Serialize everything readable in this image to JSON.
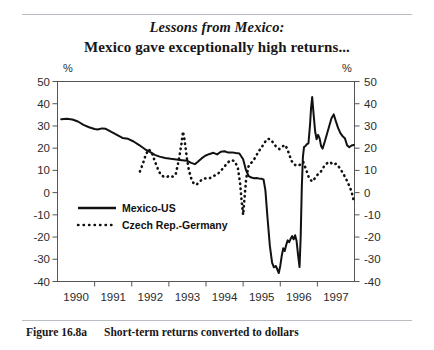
{
  "title": {
    "line1": "Lessons from Mexico:",
    "line2": "Mexico gave exceptionally high returns..."
  },
  "caption": {
    "label": "Figure 16.8a",
    "text": "Short-term returns converted to dollars"
  },
  "colors": {
    "ink": "#111111",
    "axis": "#555555",
    "rule": "#b9bcc2",
    "background": "#ffffff"
  },
  "chart_data": {
    "type": "line",
    "title": "Mexico gave exceptionally high returns...",
    "subtitle": "Lessons from Mexico:",
    "xlabel": "",
    "ylabel": "%",
    "ylabel_right": "%",
    "ylim": [
      -40,
      50
    ],
    "yticks": [
      50,
      40,
      30,
      20,
      10,
      0,
      -10,
      -20,
      -30,
      -40
    ],
    "ytick_labels": [
      "50",
      "40",
      "30",
      "20",
      "10",
      "0",
      "-10",
      "-20",
      "-30",
      "-40"
    ],
    "ytick_labels_right": [
      "50",
      "40",
      "30",
      "20",
      "10",
      "0",
      "-10",
      "-20",
      "-30",
      "-40"
    ],
    "xlim": [
      1989.5,
      1997.5
    ],
    "xticks": [
      1990,
      1991,
      1992,
      1993,
      1994,
      1995,
      1996,
      1997
    ],
    "xtick_labels": [
      "1990",
      "1991",
      "1992",
      "1993",
      "1994",
      "1995",
      "1996",
      "1997"
    ],
    "grid": false,
    "legend_position": "center-left",
    "series": [
      {
        "name": "Mexico-US",
        "style": "solid",
        "color": "#111111",
        "points": [
          [
            1989.6,
            33.0
          ],
          [
            1989.75,
            33.2
          ],
          [
            1989.9,
            32.9
          ],
          [
            1990.05,
            32.0
          ],
          [
            1990.2,
            30.5
          ],
          [
            1990.35,
            29.4
          ],
          [
            1990.5,
            28.6
          ],
          [
            1990.58,
            28.4
          ],
          [
            1990.7,
            28.9
          ],
          [
            1990.8,
            28.7
          ],
          [
            1990.95,
            27.3
          ],
          [
            1991.1,
            26.0
          ],
          [
            1991.25,
            24.6
          ],
          [
            1991.4,
            24.2
          ],
          [
            1991.55,
            23.0
          ],
          [
            1991.7,
            21.4
          ],
          [
            1991.85,
            19.6
          ],
          [
            1992.0,
            18.2
          ],
          [
            1992.12,
            17.0
          ],
          [
            1992.25,
            16.2
          ],
          [
            1992.4,
            15.6
          ],
          [
            1992.55,
            15.2
          ],
          [
            1992.7,
            14.9
          ],
          [
            1992.85,
            14.6
          ],
          [
            1993.0,
            14.3
          ],
          [
            1993.1,
            13.4
          ],
          [
            1993.2,
            12.8
          ],
          [
            1993.28,
            13.9
          ],
          [
            1993.38,
            15.4
          ],
          [
            1993.48,
            16.6
          ],
          [
            1993.58,
            17.3
          ],
          [
            1993.7,
            17.9
          ],
          [
            1993.8,
            17.2
          ],
          [
            1993.9,
            18.4
          ],
          [
            1994.0,
            18.6
          ],
          [
            1994.1,
            18.0
          ],
          [
            1994.2,
            18.1
          ],
          [
            1994.3,
            17.8
          ],
          [
            1994.4,
            17.6
          ],
          [
            1994.5,
            15.0
          ],
          [
            1994.58,
            10.0
          ],
          [
            1994.65,
            7.4
          ],
          [
            1994.72,
            6.8
          ],
          [
            1994.8,
            6.5
          ],
          [
            1994.86,
            6.6
          ],
          [
            1994.92,
            6.4
          ],
          [
            1995.0,
            6.2
          ],
          [
            1995.05,
            5.9
          ],
          [
            1995.1,
            1.0
          ],
          [
            1995.16,
            -12.0
          ],
          [
            1995.22,
            -24.0
          ],
          [
            1995.28,
            -31.5
          ],
          [
            1995.33,
            -33.6
          ],
          [
            1995.38,
            -33.0
          ],
          [
            1995.42,
            -34.5
          ],
          [
            1995.46,
            -36.2
          ],
          [
            1995.5,
            -33.0
          ],
          [
            1995.54,
            -28.5
          ],
          [
            1995.58,
            -25.0
          ],
          [
            1995.62,
            -26.3
          ],
          [
            1995.66,
            -23.6
          ],
          [
            1995.7,
            -21.5
          ],
          [
            1995.74,
            -22.3
          ],
          [
            1995.78,
            -20.8
          ],
          [
            1995.82,
            -19.6
          ],
          [
            1995.86,
            -21.0
          ],
          [
            1995.9,
            -19.2
          ],
          [
            1995.94,
            -21.8
          ],
          [
            1995.98,
            -28.0
          ],
          [
            1996.02,
            -33.5
          ],
          [
            1996.05,
            -20.0
          ],
          [
            1996.08,
            2.0
          ],
          [
            1996.11,
            16.0
          ],
          [
            1996.14,
            20.5
          ],
          [
            1996.18,
            21.0
          ],
          [
            1996.22,
            21.8
          ],
          [
            1996.26,
            22.2
          ],
          [
            1996.3,
            30.0
          ],
          [
            1996.33,
            38.0
          ],
          [
            1996.36,
            43.0
          ],
          [
            1996.4,
            35.0
          ],
          [
            1996.44,
            27.5
          ],
          [
            1996.48,
            24.0
          ],
          [
            1996.52,
            26.0
          ],
          [
            1996.56,
            24.4
          ],
          [
            1996.6,
            21.0
          ],
          [
            1996.64,
            19.8
          ],
          [
            1996.7,
            23.0
          ],
          [
            1996.76,
            26.5
          ],
          [
            1996.82,
            30.0
          ],
          [
            1996.88,
            33.5
          ],
          [
            1996.94,
            35.2
          ],
          [
            1997.0,
            32.0
          ],
          [
            1997.06,
            29.0
          ],
          [
            1997.12,
            26.8
          ],
          [
            1997.18,
            25.4
          ],
          [
            1997.24,
            24.5
          ],
          [
            1997.3,
            21.3
          ],
          [
            1997.36,
            20.4
          ],
          [
            1997.42,
            21.2
          ],
          [
            1997.48,
            21.4
          ]
        ]
      },
      {
        "name": "Czech Rep.-Germany",
        "style": "dotted",
        "color": "#111111",
        "points": [
          [
            1991.72,
            9.5
          ],
          [
            1991.8,
            13.0
          ],
          [
            1991.88,
            17.2
          ],
          [
            1991.96,
            19.5
          ],
          [
            1992.04,
            18.0
          ],
          [
            1992.12,
            14.2
          ],
          [
            1992.2,
            10.8
          ],
          [
            1992.28,
            8.0
          ],
          [
            1992.36,
            7.2
          ],
          [
            1992.44,
            7.0
          ],
          [
            1992.52,
            7.6
          ],
          [
            1992.6,
            7.2
          ],
          [
            1992.68,
            8.0
          ],
          [
            1992.76,
            14.0
          ],
          [
            1992.84,
            22.0
          ],
          [
            1992.88,
            27.5
          ],
          [
            1992.92,
            24.0
          ],
          [
            1992.98,
            16.0
          ],
          [
            1993.04,
            10.0
          ],
          [
            1993.1,
            6.5
          ],
          [
            1993.16,
            4.4
          ],
          [
            1993.24,
            3.5
          ],
          [
            1993.32,
            4.8
          ],
          [
            1993.4,
            6.0
          ],
          [
            1993.48,
            6.4
          ],
          [
            1993.56,
            6.2
          ],
          [
            1993.64,
            6.8
          ],
          [
            1993.72,
            7.6
          ],
          [
            1993.8,
            8.2
          ],
          [
            1993.88,
            9.4
          ],
          [
            1993.96,
            11.0
          ],
          [
            1994.04,
            12.6
          ],
          [
            1994.12,
            14.0
          ],
          [
            1994.2,
            14.6
          ],
          [
            1994.28,
            14.0
          ],
          [
            1994.36,
            11.0
          ],
          [
            1994.42,
            4.0
          ],
          [
            1994.46,
            -4.0
          ],
          [
            1994.5,
            -10.0
          ],
          [
            1994.54,
            -2.0
          ],
          [
            1994.58,
            6.0
          ],
          [
            1994.64,
            11.6
          ],
          [
            1994.7,
            13.2
          ],
          [
            1994.76,
            14.0
          ],
          [
            1994.84,
            16.2
          ],
          [
            1994.92,
            18.6
          ],
          [
            1995.0,
            20.4
          ],
          [
            1995.08,
            22.6
          ],
          [
            1995.16,
            24.2
          ],
          [
            1995.24,
            24.0
          ],
          [
            1995.32,
            22.2
          ],
          [
            1995.4,
            20.4
          ],
          [
            1995.48,
            19.6
          ],
          [
            1995.56,
            20.8
          ],
          [
            1995.64,
            21.4
          ],
          [
            1995.72,
            18.2
          ],
          [
            1995.8,
            14.4
          ],
          [
            1995.88,
            12.6
          ],
          [
            1995.96,
            12.0
          ],
          [
            1996.04,
            12.6
          ],
          [
            1996.12,
            13.8
          ],
          [
            1996.2,
            10.2
          ],
          [
            1996.28,
            6.4
          ],
          [
            1996.36,
            5.0
          ],
          [
            1996.44,
            6.6
          ],
          [
            1996.52,
            8.4
          ],
          [
            1996.6,
            9.6
          ],
          [
            1996.68,
            11.8
          ],
          [
            1996.76,
            13.2
          ],
          [
            1996.84,
            13.8
          ],
          [
            1996.92,
            12.6
          ],
          [
            1997.0,
            13.0
          ],
          [
            1997.06,
            12.0
          ],
          [
            1997.12,
            10.6
          ],
          [
            1997.18,
            9.0
          ],
          [
            1997.24,
            7.2
          ],
          [
            1997.3,
            5.2
          ],
          [
            1997.36,
            3.0
          ],
          [
            1997.42,
            0.6
          ],
          [
            1997.48,
            -3.8
          ]
        ]
      }
    ]
  }
}
